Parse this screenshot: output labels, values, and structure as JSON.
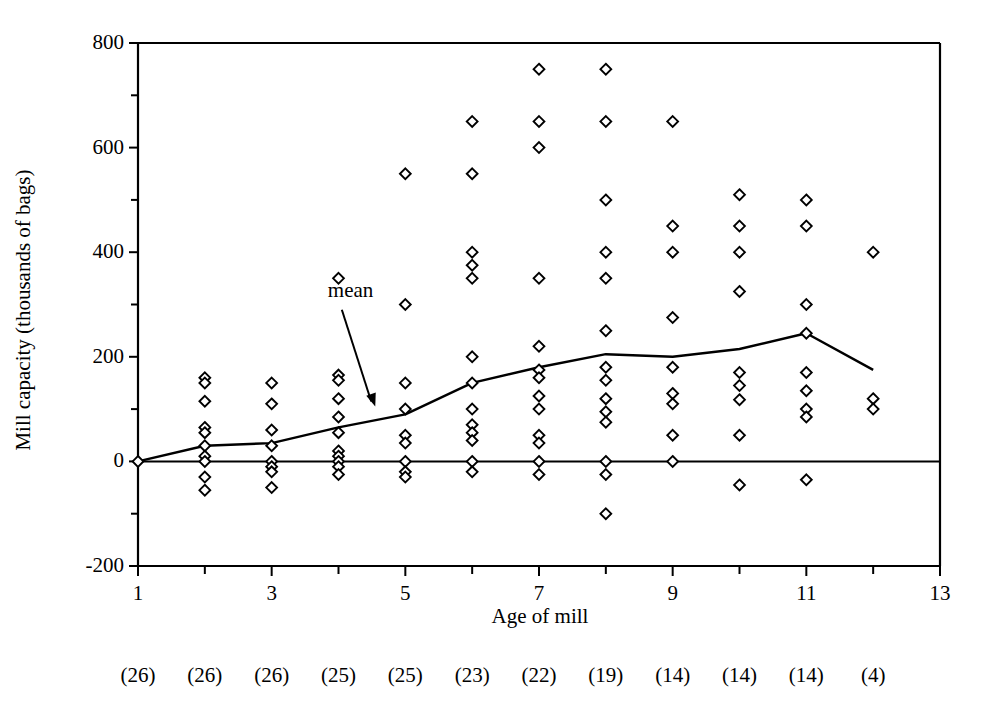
{
  "chart_data": {
    "type": "scatter",
    "title": "",
    "xlabel": "Age of mill",
    "ylabel": "Mill capacity (thousands of bags)",
    "xlim": [
      1,
      13
    ],
    "ylim": [
      -200,
      800
    ],
    "xticks": [
      1,
      2,
      3,
      4,
      5,
      6,
      7,
      8,
      9,
      10,
      11,
      12,
      13
    ],
    "xtick_labels_shown": [
      "1",
      "3",
      "5",
      "7",
      "9",
      "11",
      "13"
    ],
    "yticks": [
      -200,
      -100,
      0,
      100,
      200,
      300,
      400,
      500,
      600,
      700,
      800
    ],
    "ytick_labels_shown": [
      "-200",
      "0",
      "200",
      "400",
      "600",
      "800"
    ],
    "grid": false,
    "legend_position": "none",
    "annotations": [
      {
        "text": "mean",
        "x": 4.05,
        "y": 290,
        "arrow_to_x": 4.55,
        "arrow_to_y": 105
      }
    ],
    "marker": "open-diamond",
    "series": [
      {
        "name": "Mill capacity observations",
        "points": [
          {
            "x": 1,
            "y": 0
          },
          {
            "x": 2,
            "y": 160
          },
          {
            "x": 2,
            "y": 150
          },
          {
            "x": 2,
            "y": 115
          },
          {
            "x": 2,
            "y": 65
          },
          {
            "x": 2,
            "y": 55
          },
          {
            "x": 2,
            "y": 30
          },
          {
            "x": 2,
            "y": 10
          },
          {
            "x": 2,
            "y": 0
          },
          {
            "x": 2,
            "y": -30
          },
          {
            "x": 2,
            "y": -55
          },
          {
            "x": 3,
            "y": 150
          },
          {
            "x": 3,
            "y": 110
          },
          {
            "x": 3,
            "y": 60
          },
          {
            "x": 3,
            "y": 30
          },
          {
            "x": 3,
            "y": 0
          },
          {
            "x": 3,
            "y": -10
          },
          {
            "x": 3,
            "y": -20
          },
          {
            "x": 3,
            "y": -50
          },
          {
            "x": 4,
            "y": 350
          },
          {
            "x": 4,
            "y": 165
          },
          {
            "x": 4,
            "y": 155
          },
          {
            "x": 4,
            "y": 120
          },
          {
            "x": 4,
            "y": 85
          },
          {
            "x": 4,
            "y": 55
          },
          {
            "x": 4,
            "y": 20
          },
          {
            "x": 4,
            "y": 10
          },
          {
            "x": 4,
            "y": 0
          },
          {
            "x": 4,
            "y": -10
          },
          {
            "x": 4,
            "y": -25
          },
          {
            "x": 5,
            "y": 550
          },
          {
            "x": 5,
            "y": 300
          },
          {
            "x": 5,
            "y": 150
          },
          {
            "x": 5,
            "y": 100
          },
          {
            "x": 5,
            "y": 50
          },
          {
            "x": 5,
            "y": 35
          },
          {
            "x": 5,
            "y": 0
          },
          {
            "x": 5,
            "y": -20
          },
          {
            "x": 5,
            "y": -30
          },
          {
            "x": 6,
            "y": 650
          },
          {
            "x": 6,
            "y": 550
          },
          {
            "x": 6,
            "y": 400
          },
          {
            "x": 6,
            "y": 375
          },
          {
            "x": 6,
            "y": 350
          },
          {
            "x": 6,
            "y": 200
          },
          {
            "x": 6,
            "y": 150
          },
          {
            "x": 6,
            "y": 100
          },
          {
            "x": 6,
            "y": 70
          },
          {
            "x": 6,
            "y": 55
          },
          {
            "x": 6,
            "y": 40
          },
          {
            "x": 6,
            "y": 0
          },
          {
            "x": 6,
            "y": -20
          },
          {
            "x": 7,
            "y": 750
          },
          {
            "x": 7,
            "y": 650
          },
          {
            "x": 7,
            "y": 600
          },
          {
            "x": 7,
            "y": 350
          },
          {
            "x": 7,
            "y": 220
          },
          {
            "x": 7,
            "y": 175
          },
          {
            "x": 7,
            "y": 160
          },
          {
            "x": 7,
            "y": 125
          },
          {
            "x": 7,
            "y": 100
          },
          {
            "x": 7,
            "y": 50
          },
          {
            "x": 7,
            "y": 35
          },
          {
            "x": 7,
            "y": 0
          },
          {
            "x": 7,
            "y": -25
          },
          {
            "x": 8,
            "y": 750
          },
          {
            "x": 8,
            "y": 650
          },
          {
            "x": 8,
            "y": 500
          },
          {
            "x": 8,
            "y": 400
          },
          {
            "x": 8,
            "y": 350
          },
          {
            "x": 8,
            "y": 250
          },
          {
            "x": 8,
            "y": 180
          },
          {
            "x": 8,
            "y": 155
          },
          {
            "x": 8,
            "y": 120
          },
          {
            "x": 8,
            "y": 95
          },
          {
            "x": 8,
            "y": 75
          },
          {
            "x": 8,
            "y": 0
          },
          {
            "x": 8,
            "y": -25
          },
          {
            "x": 8,
            "y": -100
          },
          {
            "x": 9,
            "y": 650
          },
          {
            "x": 9,
            "y": 450
          },
          {
            "x": 9,
            "y": 400
          },
          {
            "x": 9,
            "y": 275
          },
          {
            "x": 9,
            "y": 180
          },
          {
            "x": 9,
            "y": 130
          },
          {
            "x": 9,
            "y": 110
          },
          {
            "x": 9,
            "y": 50
          },
          {
            "x": 9,
            "y": 0
          },
          {
            "x": 10,
            "y": 510
          },
          {
            "x": 10,
            "y": 450
          },
          {
            "x": 10,
            "y": 400
          },
          {
            "x": 10,
            "y": 325
          },
          {
            "x": 10,
            "y": 170
          },
          {
            "x": 10,
            "y": 145
          },
          {
            "x": 10,
            "y": 118
          },
          {
            "x": 10,
            "y": 50
          },
          {
            "x": 10,
            "y": -45
          },
          {
            "x": 11,
            "y": 500
          },
          {
            "x": 11,
            "y": 450
          },
          {
            "x": 11,
            "y": 300
          },
          {
            "x": 11,
            "y": 245
          },
          {
            "x": 11,
            "y": 170
          },
          {
            "x": 11,
            "y": 135
          },
          {
            "x": 11,
            "y": 100
          },
          {
            "x": 11,
            "y": 85
          },
          {
            "x": 11,
            "y": -35
          },
          {
            "x": 12,
            "y": 400
          },
          {
            "x": 12,
            "y": 120
          },
          {
            "x": 12,
            "y": 100
          }
        ]
      }
    ],
    "mean_line": {
      "name": "mean",
      "x": [
        1,
        2,
        3,
        4,
        5,
        6,
        7,
        8,
        9,
        10,
        11,
        12
      ],
      "y": [
        0,
        30,
        35,
        65,
        90,
        150,
        180,
        205,
        200,
        215,
        245,
        175
      ]
    },
    "sample_counts": {
      "label_format": "(n)",
      "values": [
        "(26)",
        "(26)",
        "(26)",
        "(25)",
        "(25)",
        "(23)",
        "(22)",
        "(19)",
        "(14)",
        "(14)",
        "(14)",
        "(4)"
      ],
      "x_positions": [
        1,
        2,
        3,
        4,
        5,
        6,
        7,
        8,
        9,
        10,
        11,
        12
      ]
    },
    "colors": {
      "axis": "#000000",
      "marker_stroke": "#000000",
      "marker_fill": "#ffffff",
      "mean_line": "#000000",
      "background": "#ffffff"
    }
  }
}
